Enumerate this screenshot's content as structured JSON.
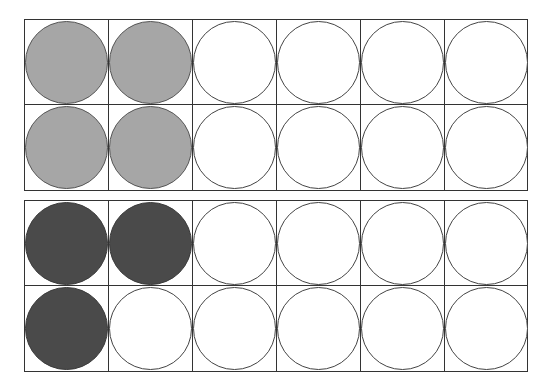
{
  "diagram": {
    "type": "ten-frame-style counters",
    "colors": {
      "light": "#a6a6a6",
      "dark": "#4a4a4a",
      "empty": "#ffffff",
      "line": "#333333"
    },
    "frames": [
      {
        "name": "top-frame",
        "rows": 2,
        "cols": 6,
        "filled_count": 4,
        "fill": "light",
        "cells": [
          [
            "light",
            "light",
            "empty",
            "empty",
            "empty",
            "empty"
          ],
          [
            "light",
            "light",
            "empty",
            "empty",
            "empty",
            "empty"
          ]
        ]
      },
      {
        "name": "bottom-frame",
        "rows": 2,
        "cols": 6,
        "filled_count": 3,
        "fill": "dark",
        "cells": [
          [
            "dark",
            "dark",
            "empty",
            "empty",
            "empty",
            "empty"
          ],
          [
            "dark",
            "empty",
            "empty",
            "empty",
            "empty",
            "empty"
          ]
        ]
      }
    ]
  }
}
